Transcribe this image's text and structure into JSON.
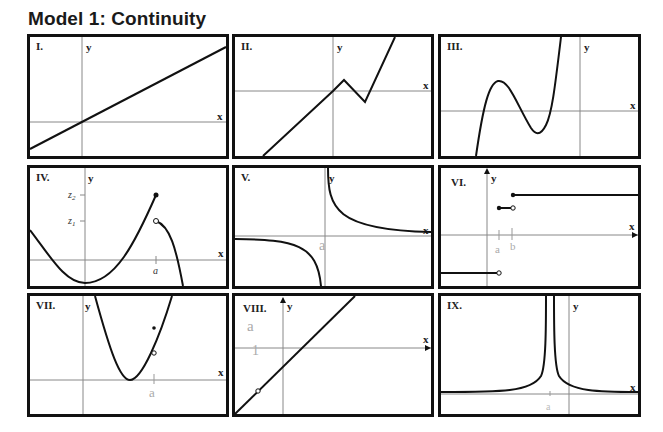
{
  "title": "Model 1: Continuity",
  "panels": [
    {
      "id": "I",
      "label": "I.",
      "x_axis": "x",
      "y_axis": "y",
      "description": "Straight line with positive slope through origin"
    },
    {
      "id": "II",
      "label": "II.",
      "x_axis": "x",
      "y_axis": "y",
      "description": "Piecewise linear with a peak then dip, then steep rise (continuous, with corners)"
    },
    {
      "id": "III",
      "label": "III.",
      "x_axis": "x",
      "y_axis": "y",
      "description": "Cubic polynomial with local max and local min"
    },
    {
      "id": "IV",
      "label": "IV.",
      "x_axis": "x",
      "y_axis": "y",
      "ticks": {
        "z2": "z2",
        "z1": "z1",
        "a": "a"
      },
      "description": "Jump discontinuity at x=a: closed point at z2, open point at z1"
    },
    {
      "id": "V",
      "label": "V.",
      "x_axis": "x",
      "y_axis": "y",
      "handwritten": "a",
      "description": "Hyperbola with vertical asymptote at x=a"
    },
    {
      "id": "VI",
      "label": "VI.",
      "x_axis": "x",
      "y_axis": "y",
      "handwritten": [
        "a",
        "b"
      ],
      "description": "Step function with jumps"
    },
    {
      "id": "VII",
      "label": "VII.",
      "x_axis": "x",
      "y_axis": "y",
      "handwritten": "a",
      "description": "Parabola with removable discontinuity at x=a (open point on curve, filled point above)"
    },
    {
      "id": "VIII",
      "label": "VIII.",
      "x_axis": "x",
      "y_axis": "y",
      "handwritten": [
        "a",
        "1"
      ],
      "description": "Line with a hole (open point)"
    },
    {
      "id": "IX",
      "label": "IX.",
      "x_axis": "x",
      "y_axis": "y",
      "handwritten": "a",
      "description": "Vertical asymptote at x=a, both sides going to +infinity"
    }
  ]
}
